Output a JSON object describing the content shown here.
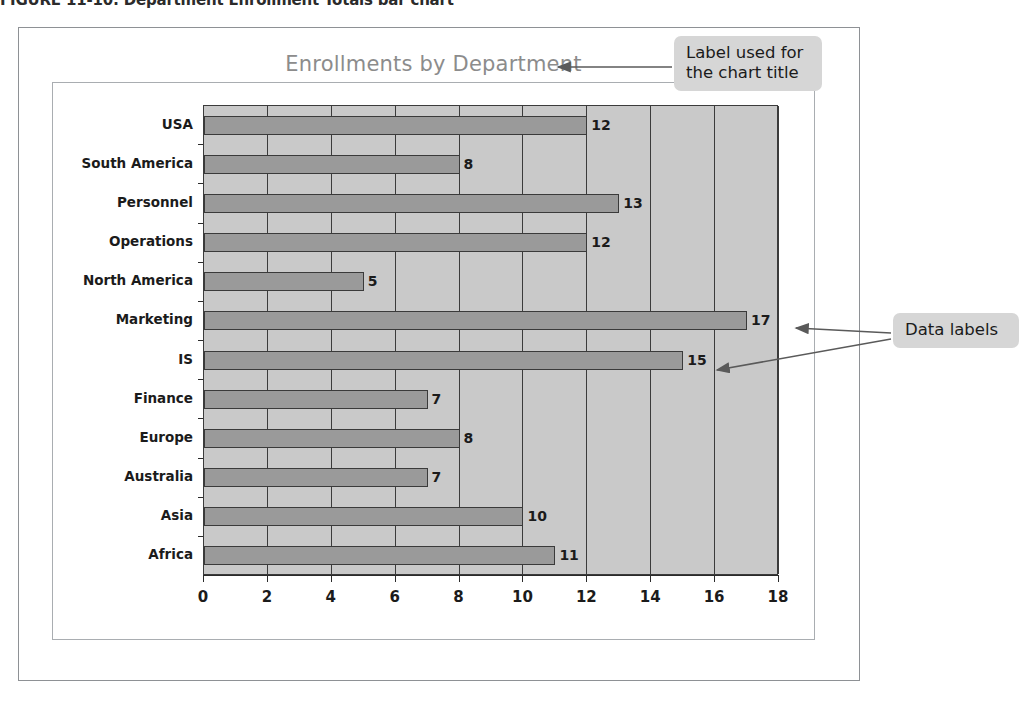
{
  "figure": {
    "caption": "FIGURE 11-10: Department Enrollment Totals bar chart"
  },
  "callouts": {
    "title_label": "Label used for\nthe chart title",
    "title_label_line1": "Label used for",
    "title_label_line2": "the chart title",
    "data_labels": "Data labels"
  },
  "colors": {
    "plot_background": "#c9c9c9",
    "bar_fill": "#9a9a9a",
    "bar_stroke": "#3a3a3a",
    "gridline": "#3b3b3b",
    "title_text": "#8c8c8c",
    "callout_background": "#d6d6d6",
    "frame_border": "#8e9195"
  },
  "chart_data": {
    "type": "bar",
    "orientation": "horizontal",
    "title": "Enrollments by Department",
    "xlabel": "",
    "ylabel": "",
    "categories": [
      "USA",
      "South America",
      "Personnel",
      "Operations",
      "North America",
      "Marketing",
      "IS",
      "Finance",
      "Europe",
      "Australia",
      "Asia",
      "Africa"
    ],
    "values": [
      12,
      8,
      13,
      12,
      5,
      17,
      15,
      7,
      8,
      7,
      10,
      11
    ],
    "data_labels": [
      "12",
      "8",
      "13",
      "12",
      "5",
      "17",
      "15",
      "7",
      "8",
      "7",
      "10",
      "11"
    ],
    "xlim": [
      0,
      18
    ],
    "xticks": [
      0,
      2,
      4,
      6,
      8,
      10,
      12,
      14,
      16,
      18
    ],
    "xtick_labels": [
      "0",
      "2",
      "4",
      "6",
      "8",
      "10",
      "12",
      "14",
      "16",
      "18"
    ],
    "grid": true,
    "grid_axis": "x",
    "legend": false
  }
}
